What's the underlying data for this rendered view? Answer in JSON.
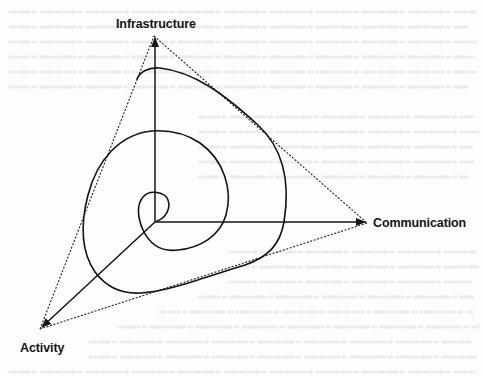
{
  "diagram": {
    "type": "three-axis spiral diagram",
    "axes": [
      {
        "id": "infrastructure",
        "label": "Infrastructure",
        "direction": "up"
      },
      {
        "id": "communication",
        "label": "Communication",
        "direction": "right"
      },
      {
        "id": "activity",
        "label": "Activity",
        "direction": "down-left"
      }
    ],
    "elements": {
      "origin": "center point where three axes meet",
      "envelope": "dotted triangle joining the three axis tips",
      "spiral": "solid curve spiralling outward from the origin through three turns"
    },
    "colors": {
      "ink": "#141414",
      "background": "#fdfdfd",
      "bleed_through": "#e6e6e6"
    }
  }
}
